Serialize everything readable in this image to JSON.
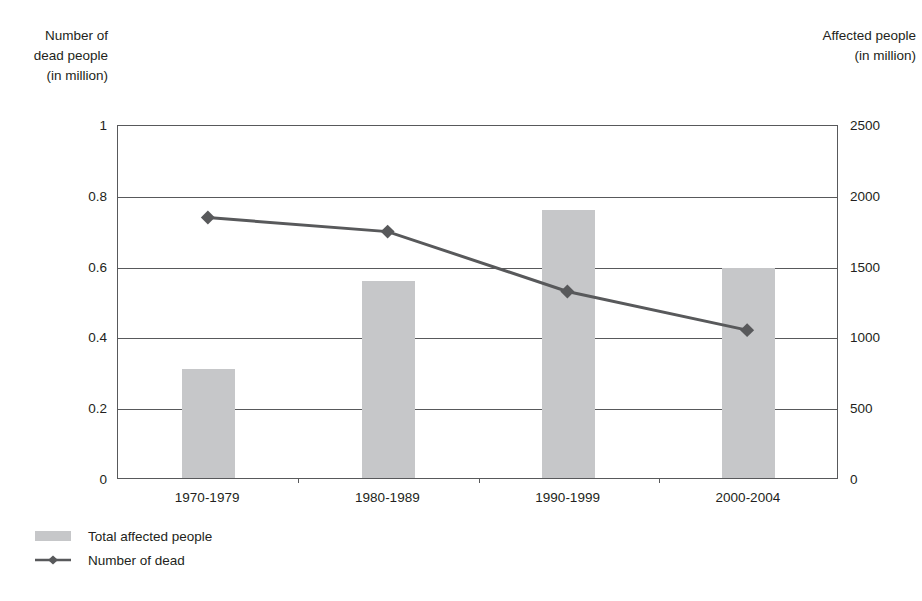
{
  "chart_data": {
    "type": "bar",
    "title": "",
    "categories": [
      "1970-1979",
      "1980-1989",
      "1990-1999",
      "2000-2004"
    ],
    "series": [
      {
        "name": "Total affected people",
        "type": "bar",
        "axis": "right",
        "values": [
          770,
          1390,
          1890,
          1480
        ],
        "color": "#c6c7c9"
      },
      {
        "name": "Number of dead",
        "type": "line",
        "axis": "left",
        "values": [
          0.74,
          0.7,
          0.53,
          0.42
        ],
        "color": "#58595b",
        "marker": "diamond"
      }
    ],
    "xlabel": "",
    "ylabel": "Number of dead people (in million)",
    "y2label": "Affected people (in million)",
    "ylim": [
      0,
      1
    ],
    "y2lim": [
      0,
      2500
    ],
    "yticks": [
      "0",
      "0.2",
      "0.4",
      "0.6",
      "0.8",
      "1"
    ],
    "ytick_values": [
      0,
      0.2,
      0.4,
      0.6,
      0.8,
      1
    ],
    "y2ticks": [
      "0",
      "500",
      "1000",
      "1500",
      "2000",
      "2500"
    ],
    "y2tick_values": [
      0,
      500,
      1000,
      1500,
      2000,
      2500
    ],
    "grid": true,
    "legend_position": "bottom-left"
  },
  "axes": {
    "left_title": "Number of\ndead people\n(in million)",
    "right_title": "Affected people\n(in million)"
  },
  "legend": {
    "items": [
      {
        "label": "Total affected people",
        "swatch": "bar-swatch"
      },
      {
        "label": "Number of dead",
        "swatch": "line-marker-swatch"
      }
    ]
  }
}
